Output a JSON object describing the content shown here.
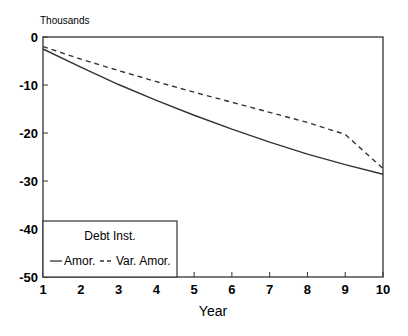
{
  "chart_data": {
    "type": "line",
    "title": "",
    "unit_label": "Thousands",
    "xlabel": "Year",
    "ylabel": "",
    "x": [
      1,
      2,
      3,
      4,
      5,
      6,
      7,
      8,
      9,
      10
    ],
    "xlim": [
      1,
      10
    ],
    "ylim": [
      -50,
      0
    ],
    "xticks": [
      "1",
      "2",
      "3",
      "4",
      "5",
      "6",
      "7",
      "8",
      "9",
      "10"
    ],
    "yticks": [
      "0",
      "-10",
      "-20",
      "-30",
      "-40",
      "-50"
    ],
    "grid": false,
    "legend": {
      "title": "Debt Inst.",
      "position": "lower left",
      "entries": [
        "Amor.",
        "Var. Amor."
      ]
    },
    "series": [
      {
        "name": "Amor.",
        "style": "solid",
        "values": [
          -2.5,
          -6.3,
          -9.9,
          -13.2,
          -16.3,
          -19.2,
          -21.9,
          -24.4,
          -26.6,
          -28.6
        ]
      },
      {
        "name": "Var. Amor.",
        "style": "dashed",
        "values": [
          -2.0,
          -4.6,
          -7.0,
          -9.3,
          -11.5,
          -13.6,
          -15.7,
          -17.8,
          -20.3,
          -27.4
        ]
      }
    ]
  }
}
